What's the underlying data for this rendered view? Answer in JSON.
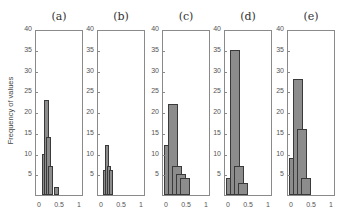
{
  "chart_data": [
    {
      "type": "bar",
      "title": "(a)",
      "xlabel": "",
      "ylabel": "Frequency of values",
      "x_bin_centers": [
        0.1,
        0.15,
        0.2,
        0.25,
        0.4
      ],
      "values": [
        10,
        23,
        14,
        7,
        2
      ],
      "xlim": [
        0,
        1
      ],
      "ylim": [
        0,
        40
      ],
      "xticks": [
        "0",
        "0.5",
        "1"
      ],
      "yticks": [
        "5",
        "10",
        "15",
        "20",
        "25",
        "30",
        "35",
        "40"
      ]
    },
    {
      "type": "bar",
      "title": "(b)",
      "xlabel": "",
      "ylabel": "",
      "x_bin_centers": [
        0.08,
        0.13,
        0.18,
        0.23
      ],
      "values": [
        6,
        12,
        7,
        6
      ],
      "xlim": [
        0,
        1
      ],
      "ylim": [
        0,
        40
      ],
      "xticks": [
        "0",
        "0.5",
        "1"
      ],
      "yticks": [
        "5",
        "10",
        "15",
        "20",
        "25",
        "30",
        "35",
        "40"
      ]
    },
    {
      "type": "bar",
      "title": "(c)",
      "xlabel": "",
      "ylabel": "",
      "x_bin_centers": [
        0.05,
        0.15,
        0.25,
        0.35,
        0.45
      ],
      "values": [
        12,
        22,
        7,
        5,
        4
      ],
      "xlim": [
        0,
        1
      ],
      "ylim": [
        0,
        40
      ],
      "xticks": [
        "0",
        "0.5",
        "1"
      ],
      "yticks": [
        "5",
        "10",
        "15",
        "20",
        "25",
        "30",
        "35",
        "40"
      ]
    },
    {
      "type": "bar",
      "title": "(d)",
      "xlabel": "",
      "ylabel": "",
      "x_bin_centers": [
        0.05,
        0.15,
        0.25,
        0.35
      ],
      "values": [
        4,
        35,
        7,
        3
      ],
      "xlim": [
        0,
        1
      ],
      "ylim": [
        0,
        40
      ],
      "xticks": [
        "0",
        "0.5",
        "1"
      ],
      "yticks": [
        "5",
        "10",
        "15",
        "20",
        "25",
        "30",
        "35",
        "40"
      ]
    },
    {
      "type": "bar",
      "title": "(e)",
      "xlabel": "",
      "ylabel": "",
      "x_bin_centers": [
        0.05,
        0.15,
        0.25,
        0.35
      ],
      "values": [
        9,
        28,
        16,
        4
      ],
      "xlim": [
        0,
        1
      ],
      "ylim": [
        0,
        40
      ],
      "xticks": [
        "0",
        "0.5",
        "1"
      ],
      "yticks": [
        "5",
        "10",
        "15",
        "20",
        "25",
        "30",
        "35",
        "40"
      ]
    }
  ],
  "layout": {
    "panel_lefts": [
      35,
      97,
      162,
      224,
      287
    ],
    "bar_width_px": [
      5,
      4,
      10,
      10,
      10
    ],
    "bar_start_px": [
      4,
      4,
      1,
      1,
      1
    ]
  }
}
